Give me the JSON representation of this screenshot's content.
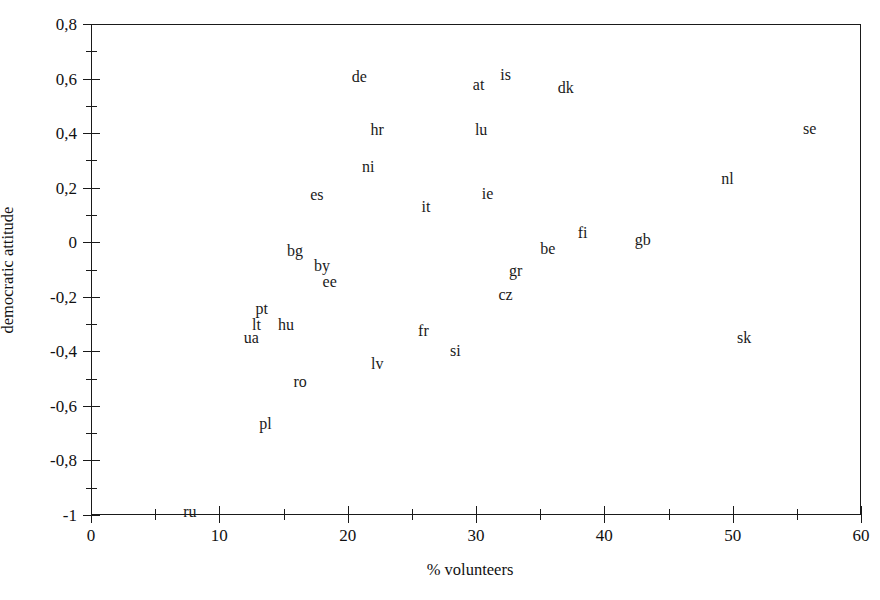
{
  "chart_data": {
    "type": "scatter",
    "title": "",
    "xlabel": "% volunteers",
    "ylabel": "democratic attitude",
    "xlim": [
      0,
      60
    ],
    "ylim": [
      -1.0,
      0.8
    ],
    "grid": false,
    "legend": "none",
    "marker_style": "text-label-only",
    "xticks": [
      0,
      10,
      20,
      30,
      40,
      50,
      60
    ],
    "xticklabels": [
      "0",
      "10",
      "20",
      "30",
      "40",
      "50",
      "60"
    ],
    "xminorticks": [
      5,
      15,
      25,
      35,
      45,
      55
    ],
    "yticks": [
      0.8,
      0.6,
      0.4,
      0.2,
      0,
      -0.2,
      -0.4,
      -0.6,
      -0.8,
      -1
    ],
    "yticklabels": [
      "0,8",
      "0,6",
      "0,4",
      "0,2",
      "0",
      "-0,2",
      "-0,4",
      "-0,6",
      "-0,8",
      "-1"
    ],
    "yminorticks": [
      0.7,
      0.5,
      0.3,
      0.1,
      -0.1,
      -0.3,
      -0.5,
      -0.7,
      -0.9
    ],
    "decimal_separator": ",",
    "points": [
      {
        "label": "de",
        "x": 20.9,
        "y": 0.606
      },
      {
        "label": "at",
        "x": 30.2,
        "y": 0.576
      },
      {
        "label": "is",
        "x": 32.3,
        "y": 0.613
      },
      {
        "label": "dk",
        "x": 37.0,
        "y": 0.565
      },
      {
        "label": "se",
        "x": 56.0,
        "y": 0.415
      },
      {
        "label": "hr",
        "x": 22.3,
        "y": 0.41
      },
      {
        "label": "lu",
        "x": 30.4,
        "y": 0.411
      },
      {
        "label": "ni",
        "x": 21.6,
        "y": 0.276
      },
      {
        "label": "nl",
        "x": 49.6,
        "y": 0.232
      },
      {
        "label": "es",
        "x": 17.6,
        "y": 0.173
      },
      {
        "label": "ie",
        "x": 30.9,
        "y": 0.177
      },
      {
        "label": "it",
        "x": 26.1,
        "y": 0.129
      },
      {
        "label": "fi",
        "x": 38.3,
        "y": 0.034
      },
      {
        "label": "gb",
        "x": 43.0,
        "y": 0.008
      },
      {
        "label": "be",
        "x": 35.6,
        "y": -0.024
      },
      {
        "label": "bg",
        "x": 15.9,
        "y": -0.032
      },
      {
        "label": "by",
        "x": 18.0,
        "y": -0.087
      },
      {
        "label": "gr",
        "x": 33.1,
        "y": -0.105
      },
      {
        "label": "ee",
        "x": 18.6,
        "y": -0.145
      },
      {
        "label": "cz",
        "x": 32.3,
        "y": -0.193
      },
      {
        "label": "pt",
        "x": 13.3,
        "y": -0.245
      },
      {
        "label": "lt",
        "x": 12.9,
        "y": -0.304
      },
      {
        "label": "hu",
        "x": 15.2,
        "y": -0.304
      },
      {
        "label": "fr",
        "x": 25.9,
        "y": -0.325
      },
      {
        "label": "sk",
        "x": 50.9,
        "y": -0.351
      },
      {
        "label": "ua",
        "x": 12.5,
        "y": -0.352
      },
      {
        "label": "si",
        "x": 28.4,
        "y": -0.399
      },
      {
        "label": "lv",
        "x": 22.3,
        "y": -0.447
      },
      {
        "label": "ro",
        "x": 16.3,
        "y": -0.513
      },
      {
        "label": "pl",
        "x": 13.6,
        "y": -0.667
      },
      {
        "label": "ru",
        "x": 7.7,
        "y": -0.988
      }
    ]
  }
}
